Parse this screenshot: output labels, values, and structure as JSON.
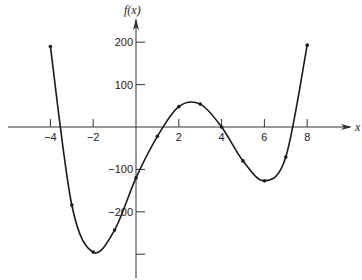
{
  "chart_data": {
    "type": "line",
    "title": "",
    "xlabel": "x",
    "ylabel": "f(x)",
    "xlim": [
      -4.5,
      10
    ],
    "ylim": [
      -350,
      230
    ],
    "grid": false,
    "legend": null,
    "x_ticks": [
      -4,
      -2,
      2,
      4,
      6,
      8
    ],
    "x_tick_labels": [
      "−4",
      "−2",
      "2",
      "4",
      "6",
      "8"
    ],
    "y_ticks": [
      200,
      100,
      -100,
      -200,
      -300
    ],
    "y_tick_labels": [
      "200",
      "100",
      "−100",
      "−200",
      ""
    ],
    "series": [
      {
        "name": "f(x)",
        "x": [
          -4,
          -3,
          -2,
          -1,
          0,
          1,
          2,
          3,
          4,
          5,
          6,
          7,
          8
        ],
        "values": [
          190,
          -184,
          -295,
          -243,
          -120,
          -22,
          48,
          54,
          0,
          -80,
          -127,
          -71,
          193
        ],
        "markers": true
      }
    ]
  },
  "style": {
    "line_color": "#1a1a1a",
    "axis_color": "#333333"
  }
}
